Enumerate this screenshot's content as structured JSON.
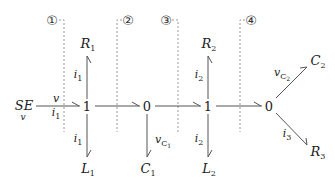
{
  "diagram": {
    "type": "bond_graph",
    "source": {
      "label": "SE",
      "sub_label": "v"
    },
    "junctions": [
      {
        "id": "j1",
        "type": "1"
      },
      {
        "id": "j2",
        "type": "0"
      },
      {
        "id": "j3",
        "type": "1"
      },
      {
        "id": "j4",
        "type": "0"
      }
    ],
    "sections": [
      {
        "id": "s1",
        "marker": "①"
      },
      {
        "id": "s2",
        "marker": "②"
      },
      {
        "id": "s3",
        "marker": "③"
      },
      {
        "id": "s4",
        "marker": "④"
      }
    ],
    "elements": {
      "R1": {
        "base": "R",
        "sub": "1"
      },
      "L1": {
        "base": "L",
        "sub": "1"
      },
      "C1": {
        "base": "C",
        "sub": "1"
      },
      "R2": {
        "base": "R",
        "sub": "2"
      },
      "L2": {
        "base": "L",
        "sub": "2"
      },
      "C2": {
        "base": "C",
        "sub": "2"
      },
      "R3": {
        "base": "R",
        "sub": "3"
      }
    },
    "bond_labels": {
      "se_effort": "v",
      "se_flow_base": "i",
      "se_flow_sub": "1",
      "r1_flow_base": "i",
      "r1_flow_sub": "1",
      "l1_flow_base": "i",
      "l1_flow_sub": "1",
      "c1_effort_base": "v",
      "c1_effort_sub": "C",
      "c1_effort_subsub": "1",
      "r2_flow_base": "i",
      "r2_flow_sub": "2",
      "l2_flow_base": "i",
      "l2_flow_sub": "2",
      "c2_effort_base": "v",
      "c2_effort_sub": "C",
      "c2_effort_subsub": "2",
      "r3_flow_base": "i",
      "r3_flow_sub": "3"
    },
    "bonds": [
      {
        "from": "SE",
        "to": "j1"
      },
      {
        "from": "j1",
        "to": "R1"
      },
      {
        "from": "j1",
        "to": "L1"
      },
      {
        "from": "j1",
        "to": "j2"
      },
      {
        "from": "j2",
        "to": "C1"
      },
      {
        "from": "j2",
        "to": "j3"
      },
      {
        "from": "j3",
        "to": "R2"
      },
      {
        "from": "j3",
        "to": "L2"
      },
      {
        "from": "j3",
        "to": "j4"
      },
      {
        "from": "j4",
        "to": "C2"
      },
      {
        "from": "j4",
        "to": "R3"
      }
    ],
    "colors": {
      "line": "#555555",
      "dashed": "#999999",
      "text": "#222222"
    }
  }
}
